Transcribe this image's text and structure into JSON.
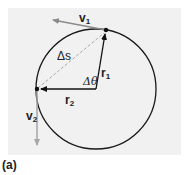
{
  "figure": {
    "caption": "(a)",
    "background_color": "#f1f1f1",
    "circle": {
      "cx": 96,
      "cy": 89,
      "r": 60,
      "stroke": "#1a1a1a"
    },
    "points": {
      "p1": {
        "x": 106,
        "y": 30
      },
      "p2": {
        "x": 37,
        "y": 89
      }
    },
    "vectors": {
      "v1": {
        "label": "v",
        "sub": "1",
        "color": "#8a8a8a"
      },
      "v2": {
        "label": "v",
        "sub": "2",
        "color": "#9a9a9a"
      },
      "r1": {
        "label": "r",
        "sub": "1",
        "color": "#111111"
      },
      "r2": {
        "label": "r",
        "sub": "2",
        "color": "#111111"
      }
    },
    "chord": {
      "label": "Δs",
      "style": "dashed",
      "color": "#a8a8a8"
    },
    "angle": {
      "label": "Δθ"
    }
  }
}
